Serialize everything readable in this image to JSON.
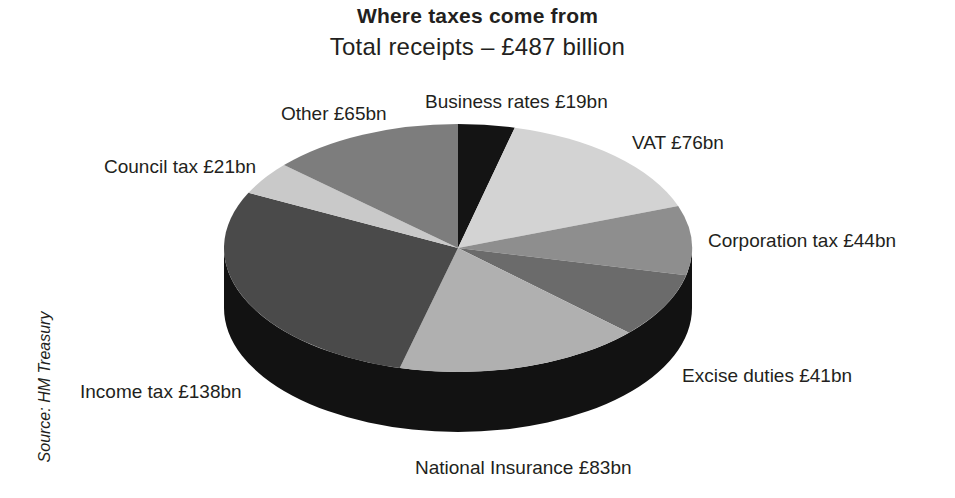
{
  "header": {
    "title": "Where taxes come from",
    "subtitle": "Total receipts – £487 billion"
  },
  "source": "Source: HM Treasury",
  "colors": {
    "background": "#ffffff",
    "text": "#231f20",
    "slice_business_rates": "#141414",
    "slice_vat": "#d3d3d3",
    "slice_corporation_tax": "#8e8e8e",
    "slice_excise_duties": "#6b6b6b",
    "slice_national_insurance": "#b0b0b0",
    "slice_income_tax": "#4a4a4a",
    "slice_council_tax": "#c9c9c9",
    "slice_other": "#7d7d7d",
    "pie_side": "#121212"
  },
  "labels": {
    "business_rates": "Business rates £19bn",
    "vat": "VAT £76bn",
    "corporation_tax": "Corporation tax £44bn",
    "excise_duties": "Excise duties £41bn",
    "national_insurance": "National Insurance £83bn",
    "income_tax": "Income tax £138bn",
    "council_tax": "Council tax £21bn",
    "other": "Other £65bn"
  },
  "chart_data": {
    "type": "pie",
    "title": "Where taxes come from",
    "subtitle": "Total receipts – £487 billion",
    "unit": "£ billion",
    "total": 487,
    "source": "Source: HM Treasury",
    "legend": "none",
    "labels_placement": "outside-callout",
    "three_d": true,
    "categories": [
      "Business rates",
      "VAT",
      "Corporation tax",
      "Excise duties",
      "National Insurance",
      "Income tax",
      "Council tax",
      "Other"
    ],
    "values": [
      19,
      76,
      44,
      41,
      83,
      138,
      21,
      65
    ],
    "value_labels": [
      "£19bn",
      "£76bn",
      "£44bn",
      "£41bn",
      "£83bn",
      "£138bn",
      "£21bn",
      "£65bn"
    ],
    "slice_colors": [
      "#141414",
      "#d3d3d3",
      "#8e8e8e",
      "#6b6b6b",
      "#b0b0b0",
      "#4a4a4a",
      "#c9c9c9",
      "#7d7d7d"
    ],
    "order": "clockwise-from-12-oclock"
  }
}
